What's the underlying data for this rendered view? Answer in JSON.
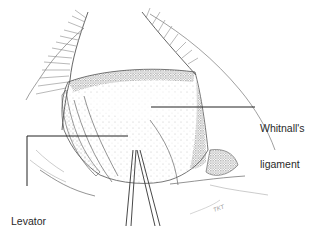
{
  "figure": {
    "stroke_color": "#444444",
    "stipple_color": "#6a6a6a",
    "leader_color": "#222222"
  },
  "labels": {
    "whitnall": {
      "line1": "Whitnall's",
      "line2": "ligament"
    },
    "levator": {
      "line1": "Levator",
      "line2": "aponeurosis"
    }
  },
  "signature": "TKT"
}
